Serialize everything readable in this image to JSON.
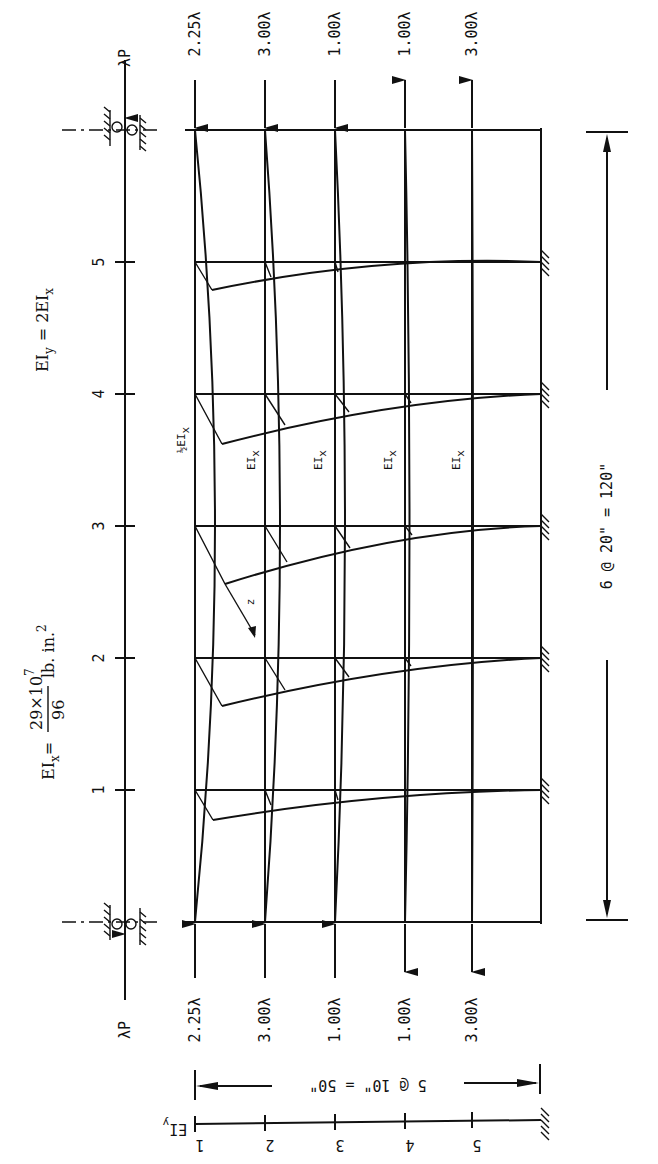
{
  "diagram": {
    "orientation": "rotated 90° clockwise",
    "formula_eix": {
      "lhs": "EI",
      "lhs_sub": "x",
      "eq": "=",
      "numerator": "29×10",
      "numerator_exp": "7",
      "denominator": "96",
      "units": "lb. in.",
      "units_exp": "2"
    },
    "formula_eiy": {
      "lhs": "EI",
      "lhs_sub": "y",
      "rhs": "= 2EI",
      "rhs_sub": "x"
    },
    "axis_ticks": [
      "1",
      "2",
      "3",
      "4",
      "5"
    ],
    "top_load": "λP",
    "bottom_load": "λP",
    "top_column_loads": [
      "2.25λ",
      "3.00λ",
      "1.00λ",
      "1.00λ",
      "3.00λ"
    ],
    "bottom_column_loads": [
      "2.25λ",
      "3.00λ",
      "1.00λ",
      "1.00λ",
      "3.00λ"
    ],
    "member_labels": [
      {
        "text": "½EI",
        "sub": "x"
      },
      {
        "text": "EI",
        "sub": "x"
      },
      {
        "text": "EI",
        "sub": "x"
      },
      {
        "text": "EI",
        "sub": "x"
      },
      {
        "text": "EI",
        "sub": "x"
      }
    ],
    "z_label": "z",
    "span_dimension": "6 @ 20\" = 120\"",
    "bottom_dimension": "5 @ 10\" = 50\"",
    "bottom_axis_label": "EI",
    "bottom_axis_sub": "y",
    "bottom_axis_ticks": [
      "1",
      "2",
      "3",
      "4",
      "5"
    ]
  }
}
